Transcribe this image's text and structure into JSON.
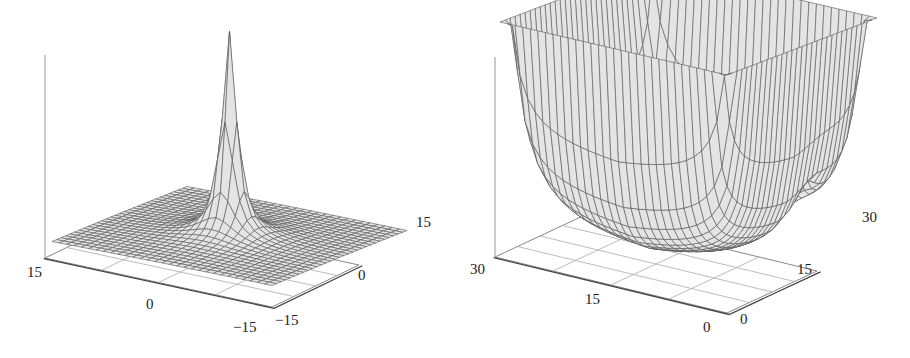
{
  "colors": {
    "surface_fill": "#e4e4e4",
    "mesh_line": "#555555",
    "box_line": "#888888",
    "axis_line": "#444444",
    "text": "#222222"
  },
  "chart_data": [
    {
      "type": "surface3d",
      "title": "",
      "description": "Single sharp central peak over a flat plane, gentle depressions on either side of the peak",
      "x_ticks": [
        "15",
        "0",
        "−15"
      ],
      "y_ticks": [
        "−15",
        "0",
        "15"
      ],
      "xlim": [
        -15,
        15
      ],
      "ylim": [
        -15,
        15
      ],
      "z_ticks": [],
      "grid_resolution": 30,
      "peak": {
        "x": 0,
        "y": 0,
        "note": "truncated at top"
      }
    },
    {
      "type": "surface3d",
      "title": "",
      "description": "Bowl-shaped surface rising steeply at the four corners with a sharp narrow peak in the interior",
      "x_ticks": [
        "30",
        "15",
        "0"
      ],
      "y_ticks": [
        "0",
        "15",
        "30"
      ],
      "xlim": [
        0,
        30
      ],
      "ylim": [
        0,
        30
      ],
      "z_ticks": [],
      "grid_resolution": 30,
      "peak": {
        "x": 5,
        "y": 20,
        "note": "narrow spike, truncated at top"
      }
    }
  ],
  "panels": [
    {
      "ticks": [
        {
          "label": "15",
          "x": 27,
          "y": 265
        },
        {
          "label": "0",
          "x": 146,
          "y": 297
        },
        {
          "label": "−15",
          "x": 233,
          "y": 320
        },
        {
          "label": "−15",
          "x": 275,
          "y": 313
        },
        {
          "label": "0",
          "x": 358,
          "y": 268
        },
        {
          "label": "15",
          "x": 416,
          "y": 215
        }
      ]
    },
    {
      "ticks": [
        {
          "label": "30",
          "x": 15,
          "y": 262
        },
        {
          "label": "15",
          "x": 130,
          "y": 292
        },
        {
          "label": "0",
          "x": 248,
          "y": 320
        },
        {
          "label": "0",
          "x": 285,
          "y": 312
        },
        {
          "label": "15",
          "x": 342,
          "y": 262
        },
        {
          "label": "30",
          "x": 407,
          "y": 210
        }
      ]
    }
  ]
}
